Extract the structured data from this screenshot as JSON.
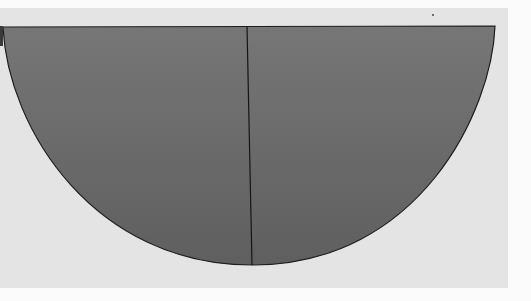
{
  "image": {
    "description": "Photograph of a minimalist artwork: a dark gray semicircle divided into two quarter sections by a vertical line, on a light gray ground",
    "colors": {
      "background_outer": "#fbfbfb",
      "background_panel": "#e4e4e4",
      "shape_fill_top": "#747474",
      "shape_fill_bottom": "#626262",
      "outline": "#1e1e1e"
    }
  }
}
